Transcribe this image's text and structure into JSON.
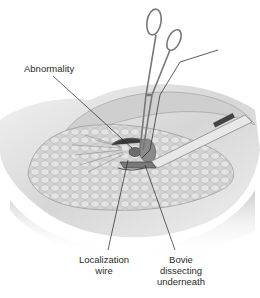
{
  "figure": {
    "labels": {
      "abnormality": "Abnormality",
      "localization_wire_line1": "Localization",
      "localization_wire_line2": "wire",
      "bovie_line1": "Bovie",
      "bovie_line2": "dissecting",
      "bovie_line3": "underneath"
    },
    "elements": [
      "breast-tissue",
      "hemostat-clamp",
      "localization-wire",
      "bovie-electrocautery-pen",
      "abnormality-lesion"
    ],
    "colors": {
      "background": "#ffffff",
      "tissue_light": "#e6e6e6",
      "tissue_mid": "#bdbdbd",
      "tissue_dark": "#7a7a7a",
      "leader_line": "#222222",
      "text": "#2a2a2a"
    }
  }
}
